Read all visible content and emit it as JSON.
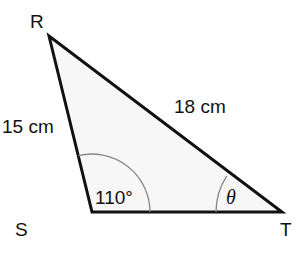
{
  "diagram": {
    "type": "triangle",
    "vertices": {
      "R": {
        "label": "R"
      },
      "S": {
        "label": "S"
      },
      "T": {
        "label": "T"
      }
    },
    "sides": {
      "RS": {
        "label": "15 cm"
      },
      "RT": {
        "label": "18 cm"
      }
    },
    "angles": {
      "S": {
        "label": "110°"
      },
      "T": {
        "label": "θ"
      }
    },
    "colors": {
      "stroke": "#111111",
      "fill": "#f7f7f7",
      "arc": "#888888"
    }
  }
}
